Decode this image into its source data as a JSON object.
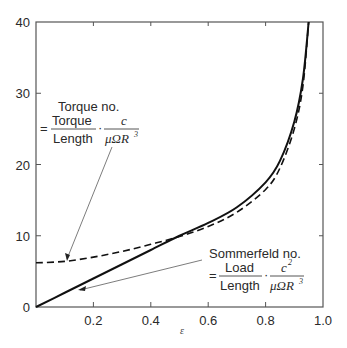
{
  "chart_data": {
    "type": "line",
    "title": "",
    "xlabel": "ε",
    "ylabel": "",
    "xlim": [
      0,
      1.0
    ],
    "ylim": [
      0,
      40
    ],
    "grid": false,
    "legend": null,
    "x_ticks": [
      "0.2",
      "0.4",
      "0.6",
      "0.8",
      "1.0"
    ],
    "x_tick_values": [
      0.2,
      0.4,
      0.6,
      0.8,
      1.0
    ],
    "y_ticks": [
      "0",
      "10",
      "20",
      "30",
      "40"
    ],
    "y_tick_values": [
      0,
      10,
      20,
      30,
      40
    ],
    "series": [
      {
        "name": "Sommerfeld no.",
        "style": "solid",
        "x": [
          0.0,
          0.1,
          0.2,
          0.3,
          0.4,
          0.5,
          0.6,
          0.7,
          0.8,
          0.85,
          0.9,
          0.93,
          0.95
        ],
        "values": [
          0.0,
          2.0,
          4.0,
          6.0,
          8.0,
          10.0,
          11.8,
          14.0,
          17.5,
          20.5,
          26.0,
          32.0,
          40.0
        ]
      },
      {
        "name": "Torque no.",
        "style": "dashed",
        "x": [
          0.0,
          0.1,
          0.2,
          0.3,
          0.4,
          0.5,
          0.6,
          0.7,
          0.8,
          0.85,
          0.9,
          0.93,
          0.95
        ],
        "values": [
          6.2,
          6.4,
          7.0,
          7.8,
          8.8,
          9.9,
          11.3,
          13.3,
          16.5,
          19.5,
          25.0,
          31.0,
          40.0
        ]
      }
    ],
    "annotations": [
      {
        "id": "torque",
        "title": "Torque no.",
        "equals": "=",
        "fraction1_num": "Torque",
        "fraction1_den": "Length",
        "dot": "·",
        "fraction2_num": "c",
        "fraction2_den": "μΩR",
        "fraction2_den_exp": "3",
        "arrow_target_x": 0.1,
        "arrow_target_y": 6.4
      },
      {
        "id": "sommerfeld",
        "title": "Sommerfeld no.",
        "equals": "=",
        "fraction1_num": "Load",
        "fraction1_den": "Length",
        "dot": "·",
        "fraction2_num": "c",
        "fraction2_num_exp": "2",
        "fraction2_den": "μΩR",
        "fraction2_den_exp": "3",
        "arrow_target_x": 0.15,
        "arrow_target_y": 3.0
      }
    ]
  }
}
